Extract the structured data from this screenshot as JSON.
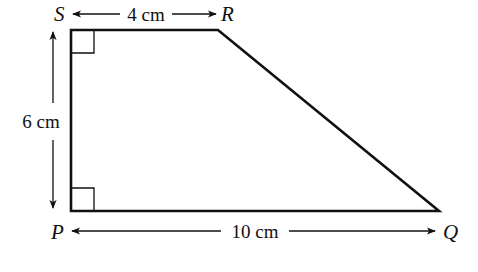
{
  "diagram": {
    "type": "right trapezium",
    "vertices": {
      "S": {
        "label": "S",
        "x": 71,
        "y": 30
      },
      "R": {
        "label": "R",
        "x": 218,
        "y": 30
      },
      "Q": {
        "label": "Q",
        "x": 439,
        "y": 211
      },
      "P": {
        "label": "P",
        "x": 71,
        "y": 211
      }
    },
    "dimensions": {
      "top": {
        "label": "4 cm",
        "from": "S",
        "to": "R"
      },
      "left": {
        "label": "6 cm",
        "from": "S",
        "to": "P"
      },
      "bottom": {
        "label": "10 cm",
        "from": "P",
        "to": "Q"
      }
    },
    "right_angles": [
      "S",
      "P"
    ],
    "colors": {
      "line": "#111111",
      "background": "#ffffff"
    }
  }
}
